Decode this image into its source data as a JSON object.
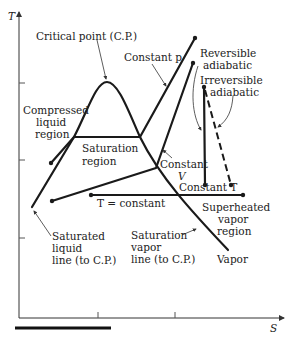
{
  "diagram": {
    "axes": {
      "y_label": "T",
      "x_label": "S"
    },
    "labels": {
      "critical_point": "Critical point (C.P.)",
      "constant_p": "Constant p",
      "reversible_adiabatic_1": "Reversible",
      "reversible_adiabatic_2": "adiabatic",
      "irreversible_adiabatic_1": "Irreversible",
      "irreversible_adiabatic_2": "adiabatic",
      "compressed_liquid_1": "Compressed",
      "compressed_liquid_2": "liquid",
      "compressed_liquid_3": "region",
      "saturation_region_1": "Saturation",
      "saturation_region_2": "region",
      "constant_v_1": "Constant",
      "constant_v_2": "V",
      "constant_t_right": "Constant T",
      "t_constant": "T = constant",
      "superheated_1": "Superheated",
      "superheated_2": "vapor",
      "superheated_3": "region",
      "saturated_liquid_1": "Saturated",
      "saturated_liquid_2": "liquid",
      "saturated_liquid_3": "line (to C.P.)",
      "saturation_vapor_1": "Saturation",
      "saturation_vapor_2": "vapor",
      "saturation_vapor_3": "line (to C.P.)",
      "vapor": "Vapor"
    },
    "colors": {
      "line": "#1a1a1a",
      "text": "#222222",
      "background": "#ffffff"
    }
  }
}
